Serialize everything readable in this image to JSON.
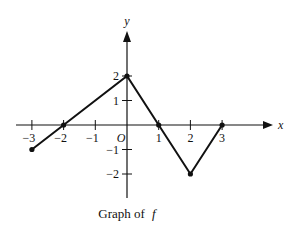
{
  "chart_data": {
    "type": "line",
    "title": "",
    "caption": "Graph of",
    "function_name": "f",
    "xlabel": "x",
    "ylabel": "y",
    "origin_label": "O",
    "xlim": [
      -3.5,
      4.5
    ],
    "ylim": [
      -2.5,
      3.5
    ],
    "grid": false,
    "legend": null,
    "x_ticks": [
      -3,
      -2,
      -1,
      1,
      2,
      3
    ],
    "x_tick_labels": [
      "−3",
      "−2",
      "−1",
      "1",
      "2",
      "3"
    ],
    "y_ticks": [
      2,
      1,
      -1,
      -2
    ],
    "y_tick_labels": [
      "2",
      "1",
      "−1",
      "−2"
    ],
    "series": [
      {
        "name": "f",
        "x": [
          -3,
          -2,
          0,
          1,
          2,
          3
        ],
        "y": [
          -1,
          0,
          2,
          0,
          -2,
          0
        ],
        "points": [
          [
            -3,
            -1
          ],
          [
            -2,
            0
          ],
          [
            0,
            2
          ],
          [
            1,
            0
          ],
          [
            2,
            -2
          ],
          [
            3,
            0
          ]
        ],
        "color": "#111111",
        "markers": true
      }
    ]
  }
}
